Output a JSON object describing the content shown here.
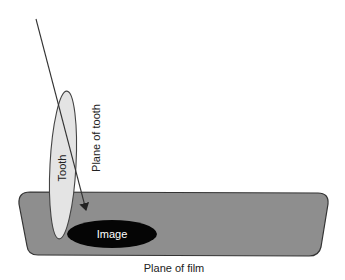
{
  "diagram": {
    "type": "dental radiography projection geometry",
    "labels": {
      "tooth": "Tooth",
      "plane_of_tooth": "Plane of tooth",
      "image": "Image",
      "plane_of_film": "Plane of film"
    },
    "colors": {
      "background": "#ffffff",
      "film_fill": "#8e8e8e",
      "film_stroke": "#333333",
      "tooth_fill": "#e4e4e4",
      "tooth_stroke": "#444444",
      "image_fill": "#050505",
      "image_text": "#ffffff",
      "line": "#333333",
      "text": "#222222"
    },
    "elements": {
      "film_plane": {
        "shape": "rounded trapezoid",
        "top_left": [
          19,
          192
        ],
        "top_right": [
          328,
          193
        ],
        "bottom_right": [
          320,
          256
        ],
        "bottom_left": [
          27,
          255
        ]
      },
      "tooth": {
        "shape": "ellipse",
        "center": [
          63,
          165
        ],
        "rx": 13,
        "ry": 74
      },
      "image": {
        "shape": "ellipse",
        "center": [
          112,
          234
        ],
        "rx": 45,
        "ry": 14
      },
      "projection_ray": {
        "from": [
          36,
          19
        ],
        "to": [
          86,
          210
        ],
        "arrowhead": "end"
      }
    }
  }
}
